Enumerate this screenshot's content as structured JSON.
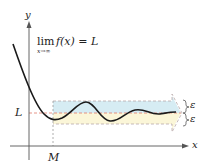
{
  "diagram": {
    "formula": {
      "lim": "lim",
      "subscript": "x→∞",
      "expression": "f(x) = L"
    },
    "axes": {
      "x_label": "x",
      "y_label": "y"
    },
    "labels": {
      "L": "L",
      "M": "M",
      "epsilon_upper": "ε",
      "epsilon_lower": "ε"
    },
    "colors": {
      "curve": "#1a1a1a",
      "axis": "#555555",
      "band_upper": "#d6ecf3",
      "band_lower": "#fbf6d8",
      "dashed_L": "#e07a6a",
      "dashed_band": "#b8a8a8"
    }
  }
}
